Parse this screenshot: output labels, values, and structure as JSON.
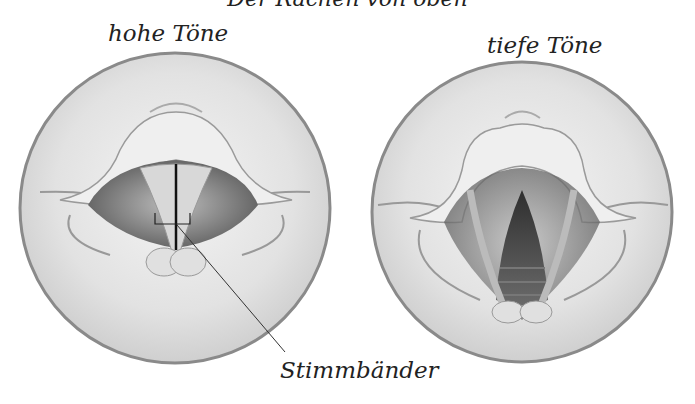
{
  "title": "Der Rachen von oben",
  "panels": [
    {
      "label": "hohe Töne",
      "state": "Stimmbänder geschlossen"
    },
    {
      "label": "tiefe Töne",
      "state": "Stimmbänder geöffnet"
    }
  ],
  "callout": {
    "label": "Stimmbänder"
  },
  "colors": {
    "ring": "#8a8a8a",
    "tissue": "#e6e6e6",
    "shadow": "#7a7a7a",
    "ink": "#222222"
  }
}
